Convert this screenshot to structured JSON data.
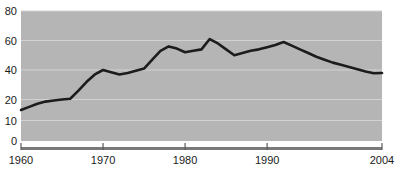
{
  "chart_data": {
    "type": "line",
    "title": "",
    "xlabel": "",
    "ylabel": "",
    "grid": true,
    "legend": "none",
    "plot_background_color": "#b5b5b5",
    "line_color": "#1c1c1c",
    "gridline_color": "#d2d2d2",
    "axis_color": "#7a7a7a",
    "xlim": [
      1960,
      2004
    ],
    "ylim": [
      0,
      80
    ],
    "y_axis_note": "non-uniform axis: 0-20 range is expanded relative to 20-80",
    "yticks": [
      0,
      10,
      20,
      40,
      60,
      80
    ],
    "ytick_labels": [
      "0",
      "10",
      "20",
      "40",
      "60",
      "80"
    ],
    "xticks": [
      1960,
      1970,
      1980,
      1990,
      2004
    ],
    "xtick_labels": [
      "1960",
      "1970",
      "1980",
      "1990",
      "2004"
    ],
    "x": [
      1960,
      1961,
      1962,
      1963,
      1964,
      1965,
      1966,
      1967,
      1968,
      1969,
      1970,
      1971,
      1972,
      1973,
      1974,
      1975,
      1976,
      1977,
      1978,
      1979,
      1980,
      1981,
      1982,
      1983,
      1984,
      1985,
      1986,
      1987,
      1988,
      1989,
      1990,
      1991,
      1992,
      1993,
      1994,
      1995,
      1996,
      1997,
      1998,
      1999,
      2000,
      2001,
      2002,
      2003,
      2004
    ],
    "values": [
      15,
      16.5,
      18,
      19,
      19.5,
      20,
      20.5,
      26,
      32,
      37,
      40,
      38.5,
      37,
      38,
      39.5,
      41,
      47,
      53,
      56,
      54.5,
      52,
      53,
      54,
      61,
      58,
      54,
      50,
      51.5,
      53,
      54,
      55.5,
      57,
      59,
      56.5,
      54,
      51.5,
      49,
      47,
      45,
      43.5,
      42,
      40.5,
      39,
      37.8,
      38
    ],
    "series": [
      {
        "name": "series-1",
        "values": [
          15,
          16.5,
          18,
          19,
          19.5,
          20,
          20.5,
          26,
          32,
          37,
          40,
          38.5,
          37,
          38,
          39.5,
          41,
          47,
          53,
          56,
          54.5,
          52,
          53,
          54,
          61,
          58,
          54,
          50,
          51.5,
          53,
          54,
          55.5,
          57,
          59,
          56.5,
          54,
          51.5,
          49,
          47,
          45,
          43.5,
          42,
          40.5,
          39,
          37.8,
          38
        ]
      }
    ],
    "annotations": []
  }
}
